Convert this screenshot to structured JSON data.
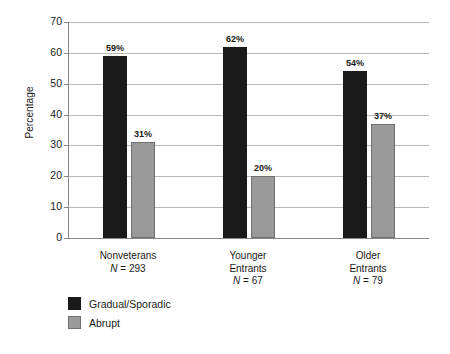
{
  "chart_data": {
    "type": "bar",
    "title": "",
    "subtitle": "",
    "xlabel": "",
    "ylabel": "Percentage",
    "ylim": [
      0,
      70
    ],
    "yticks": [
      0,
      10,
      20,
      30,
      40,
      50,
      60,
      70
    ],
    "ytick_labels": [
      "0",
      "10",
      "20",
      "30",
      "40",
      "50",
      "60",
      "70"
    ],
    "grid": "horizontal",
    "legend_position": "bottom-left",
    "categories": [
      "Nonveterans",
      "Younger Entrants",
      "Older Entrants"
    ],
    "category_lines": [
      [
        "Nonveterans"
      ],
      [
        "Younger",
        "Entrants"
      ],
      [
        "Older",
        "Entrants"
      ]
    ],
    "group_n_labels": [
      "N = 293",
      "N = 67",
      "N = 79"
    ],
    "group_n_values": [
      293,
      67,
      79
    ],
    "series": [
      {
        "name": "Gradual/Sporadic",
        "color": "#1a1a1a",
        "values": [
          59,
          62,
          54
        ],
        "data_labels": [
          "59%",
          "62%",
          "54%"
        ]
      },
      {
        "name": "Abrupt",
        "color": "#9a9a9a",
        "values": [
          31,
          20,
          37
        ],
        "data_labels": [
          "31%",
          "20%",
          "37%"
        ]
      }
    ]
  },
  "axis": {
    "y_title": "Percentage",
    "y_tick_labels": [
      "70",
      "60",
      "50",
      "40",
      "30",
      "20",
      "10",
      "0"
    ]
  },
  "legend": {
    "items": [
      {
        "label": "Gradual/Sporadic",
        "color": "#1a1a1a"
      },
      {
        "label": "Abrupt",
        "color": "#9a9a9a"
      }
    ]
  },
  "groups": [
    {
      "name_lines": [
        "Nonveterans"
      ],
      "n_label": "N = 293",
      "n_value": "293",
      "bars": [
        {
          "series": "Gradual/Sporadic",
          "value": 59,
          "label": "59%"
        },
        {
          "series": "Abrupt",
          "value": 31,
          "label": "31%"
        }
      ]
    },
    {
      "name_lines": [
        "Younger",
        "Entrants"
      ],
      "n_label": "N = 67",
      "n_value": "67",
      "bars": [
        {
          "series": "Gradual/Sporadic",
          "value": 62,
          "label": "62%"
        },
        {
          "series": "Abrupt",
          "value": 20,
          "label": "20%"
        }
      ]
    },
    {
      "name_lines": [
        "Older",
        "Entrants"
      ],
      "n_label": "N = 79",
      "n_value": "79",
      "bars": [
        {
          "series": "Gradual/Sporadic",
          "value": 54,
          "label": "54%"
        },
        {
          "series": "Abrupt",
          "value": 37,
          "label": "37%"
        }
      ]
    }
  ],
  "colors": {
    "gradual": "#1a1a1a",
    "abrupt": "#9a9a9a",
    "abrupt_border": "#6f6f6f",
    "gridline": "#b9b9b9",
    "axis": "#878787",
    "background": "#ffffff",
    "text": "#1a1a1a"
  }
}
